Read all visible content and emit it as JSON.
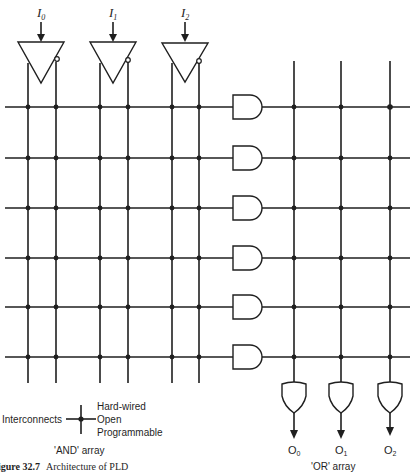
{
  "diagram": {
    "inputs": [
      {
        "label": "I",
        "sub": "0"
      },
      {
        "label": "I",
        "sub": "1"
      },
      {
        "label": "I",
        "sub": "2"
      }
    ],
    "outputs": [
      {
        "label": "O",
        "sub": "0"
      },
      {
        "label": "O",
        "sub": "1"
      },
      {
        "label": "O",
        "sub": "2"
      }
    ],
    "and_gate_count": 6,
    "or_gate_count": 3,
    "and_array_label": "'AND' array",
    "or_array_label": "'OR' array",
    "legend": {
      "title": "Interconnects",
      "items": [
        "Hard-wired",
        "Open",
        "Programmable"
      ]
    },
    "caption": {
      "number": "igure 32.7",
      "text": "Architecture of PLD"
    },
    "colors": {
      "ink": "#1f1f1f",
      "background": "#ffffff"
    }
  }
}
